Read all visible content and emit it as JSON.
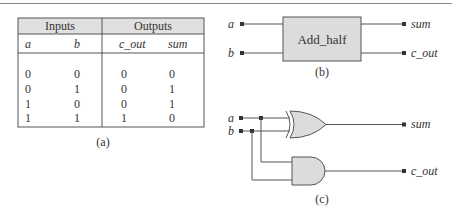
{
  "table": {
    "group_headers": [
      "Inputs",
      "Outputs"
    ],
    "columns": [
      "a",
      "b",
      "c_out",
      "sum"
    ],
    "rows": [
      [
        "0",
        "0",
        "0",
        "0"
      ],
      [
        "0",
        "1",
        "0",
        "1"
      ],
      [
        "1",
        "0",
        "0",
        "1"
      ],
      [
        "1",
        "1",
        "1",
        "0"
      ]
    ],
    "caption": "(a)"
  },
  "block_diagram": {
    "module_label": "Add_half",
    "inputs": [
      "a",
      "b"
    ],
    "outputs": [
      "sum",
      "c_out"
    ],
    "caption": "(b)"
  },
  "gate_diagram": {
    "inputs": [
      "a",
      "b"
    ],
    "outputs": [
      "sum",
      "c_out"
    ],
    "gates": [
      "xor",
      "and"
    ],
    "caption": "(c)"
  },
  "colors": {
    "line": "#555555",
    "fill": "#dcdcdc",
    "header_fill": "#e0e0e0"
  }
}
